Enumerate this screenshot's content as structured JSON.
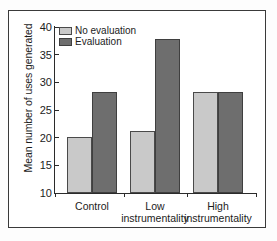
{
  "chart_data": {
    "type": "bar",
    "title": "",
    "xlabel": "",
    "ylabel": "Mean number of uses generated",
    "ylim": [
      10,
      40
    ],
    "yticks": [
      10,
      15,
      20,
      25,
      30,
      35,
      40
    ],
    "grid": false,
    "legend_position": "top-left",
    "categories": [
      "Control",
      "Low instrumentality",
      "High instrumentality"
    ],
    "category_lines": [
      {
        "line1": "Control",
        "line2": ""
      },
      {
        "line1": "Low",
        "line2": "instrumentality"
      },
      {
        "line1": "High",
        "line2": "instrumentality"
      }
    ],
    "series": [
      {
        "name": "No evaluation",
        "color": "#c9c9c9",
        "values": [
          20.2,
          21.2,
          28.3
        ]
      },
      {
        "name": "Evaluation",
        "color": "#6e6e6e",
        "values": [
          28.3,
          37.9,
          28.3
        ]
      }
    ]
  },
  "axis": {
    "y_tick_labels": [
      "40",
      "35",
      "30",
      "25",
      "20",
      "15",
      "10"
    ],
    "y_title": "Mean number of uses generated"
  },
  "legend": {
    "items": [
      {
        "label": "No evaluation",
        "swatch": "light"
      },
      {
        "label": "Evaluation",
        "swatch": "dark"
      }
    ]
  }
}
